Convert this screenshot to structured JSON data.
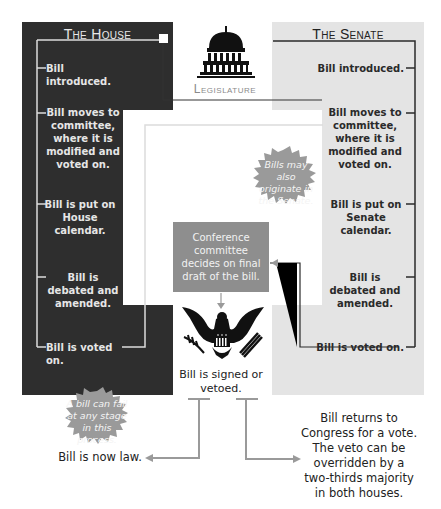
{
  "house": {
    "title": "The House",
    "steps": [
      "Bill introduced.",
      "Bill moves to committee, where it is modified and voted on.",
      "Bill is put on House calendar.",
      "Bill is debated and amended.",
      "Bill is voted on."
    ],
    "note": "A bill can fail at any stage in this process."
  },
  "senate": {
    "title": "The Senate",
    "steps": [
      "Bill introduced.",
      "Bill moves to committee, where it is modified and voted on.",
      "Bill is put on Senate calendar.",
      "Bill is debated and amended.",
      "Bill is voted on."
    ],
    "note": "Bills may also originate in the Senate."
  },
  "center": {
    "label": "Legislature",
    "icon": "capitol-icon",
    "conference": "Conference committee decides on final draft of the bill.",
    "eagle_icon": "presidential-eagle-icon",
    "signed": "Bill is signed or vetoed."
  },
  "outcomes": {
    "law": "Bill is now law.",
    "veto": "Bill returns to Congress for a vote. The veto can be overridden by a two-thirds majority in both houses."
  },
  "colors": {
    "house_bg": "#2e2e2e",
    "senate_bg": "#e4e4e4",
    "conference_bg": "#8e8e8e",
    "burst": "#9a9a9a"
  }
}
